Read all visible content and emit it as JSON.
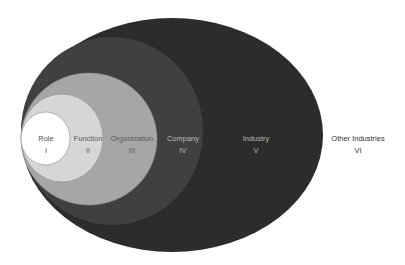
{
  "diagram": {
    "type": "nested-ellipses",
    "layers": [
      {
        "level": 6,
        "name": "Other Industries",
        "numeral": "VI",
        "fill": "#ffffff"
      },
      {
        "level": 5,
        "name": "Industry",
        "numeral": "V",
        "fill": "#2c2c2c"
      },
      {
        "level": 4,
        "name": "Company",
        "numeral": "IV",
        "fill": "#404040"
      },
      {
        "level": 3,
        "name": "Organization",
        "numeral": "III",
        "fill": "#a6a6a6"
      },
      {
        "level": 2,
        "name": "Function",
        "numeral": "II",
        "fill": "#d6d6d6"
      },
      {
        "level": 1,
        "name": "Role",
        "numeral": "I",
        "fill": "#ffffff"
      }
    ]
  }
}
